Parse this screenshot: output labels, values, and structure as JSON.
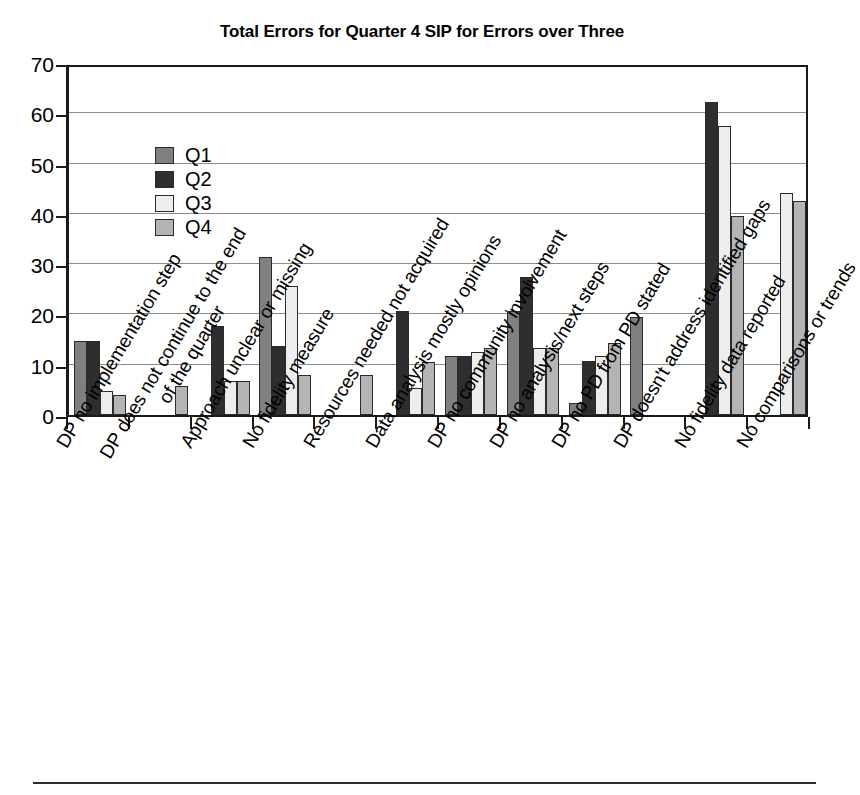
{
  "chart_data": {
    "type": "bar",
    "title": "Total Errors for Quarter 4 SIP for Errors over Three",
    "xlabel": "",
    "ylabel": "",
    "ylim": [
      0,
      70
    ],
    "ytick_step": 10,
    "ytick_labels": [
      "70",
      "60",
      "50",
      "40",
      "30",
      "20",
      "10",
      "0"
    ],
    "grid": true,
    "legend_position": "top-left-inside",
    "orientation": "vertical",
    "grouping": "clustered",
    "categories": [
      "DP no implementation step",
      "DP does not continue to the end of the quarter",
      "Approach unclear or missing",
      "No fidelity measure",
      "Resources needed not acquired",
      "Data analysis mostly opinions",
      "DP no community involvement",
      "DP no analysis/next steps",
      "DP no PD from PD stated",
      "DP doesn't address identified gaps",
      "No fidelity data reported",
      "No comparisons or trends"
    ],
    "category_labels_wrapped": [
      [
        "DP no implementation step"
      ],
      [
        "DP does not continue to the end",
        "of the quarter"
      ],
      [
        "Approach unclear or missing"
      ],
      [
        "No fidelity measure"
      ],
      [
        "Resources needed not acquired"
      ],
      [
        "Data analysis mostly opinions"
      ],
      [
        "DP no community involvement"
      ],
      [
        "DP no analysis/next steps"
      ],
      [
        "DP no PD from PD stated"
      ],
      [
        "DP doesn't address identified gaps"
      ],
      [
        "No fidelity data reported"
      ],
      [
        "No comparisons or trends"
      ]
    ],
    "series": [
      {
        "name": "Q1",
        "color": "#808080",
        "values": [
          14.7,
          0,
          0,
          31.5,
          0,
          0,
          11.8,
          20.7,
          2.4,
          19.5,
          0,
          0
        ]
      },
      {
        "name": "Q2",
        "color": "#2e2e2e",
        "values": [
          14.7,
          0,
          17.7,
          13.7,
          0,
          20.7,
          11.8,
          27.5,
          10.7,
          0,
          62.3,
          0
        ]
      },
      {
        "name": "Q3",
        "color": "#ededed",
        "values": [
          4.7,
          0,
          6.7,
          25.7,
          0,
          5.3,
          12.6,
          13.4,
          11.8,
          0,
          57.4,
          44.2
        ]
      },
      {
        "name": "Q4",
        "color": "#b4b4b4",
        "values": [
          4.0,
          5.7,
          6.7,
          8.0,
          8.0,
          10.5,
          13.4,
          13.4,
          14.4,
          0,
          39.6,
          42.5
        ]
      }
    ]
  },
  "legend": {
    "entries": [
      {
        "label": "Q1"
      },
      {
        "label": "Q2"
      },
      {
        "label": "Q3"
      },
      {
        "label": "Q4"
      }
    ]
  },
  "colors": {
    "q1": "#808080",
    "q2": "#2e2e2e",
    "q3": "#ededed",
    "q4": "#b4b4b4",
    "axis": "#1a1a1a",
    "gridline": "#8c8c8c",
    "background": "#ffffff"
  }
}
